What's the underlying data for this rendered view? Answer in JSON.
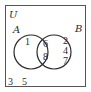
{
  "diagram": {
    "type": "venn",
    "universe_label": "U",
    "sets": [
      {
        "label": "A",
        "only": [
          "1"
        ]
      },
      {
        "label": "B",
        "only": [
          "2",
          "4",
          "7"
        ]
      }
    ],
    "intersection": [
      "6",
      "8"
    ],
    "outside": [
      "3",
      "5"
    ],
    "colors": {
      "stroke": "#2a2a2a",
      "background": "#ffffff"
    }
  }
}
